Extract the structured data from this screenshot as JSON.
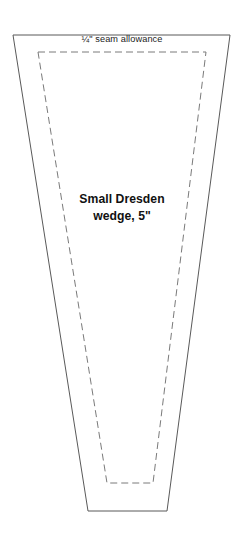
{
  "page": {
    "background_color": "#ffffff",
    "width": 244,
    "height": 540
  },
  "pattern": {
    "outline": {
      "name": "cutting-line",
      "style": "solid",
      "stroke_color": "#595959",
      "stroke_width": 1,
      "fill": "#ffffff",
      "points": "13,35 230,35 167,511 88,511"
    },
    "inner_outline": {
      "name": "stitching-line",
      "style": "dashed",
      "stroke_color": "#7a7a7a",
      "stroke_width": 1,
      "dash_pattern": "7,4",
      "fill": "none",
      "points": "38,52 206,52 153,483 107,483"
    },
    "labels": {
      "seam_allowance": "¼\" seam allowance",
      "title_line_1": "Small Dresden",
      "title_line_2": "wedge, 5\""
    }
  }
}
